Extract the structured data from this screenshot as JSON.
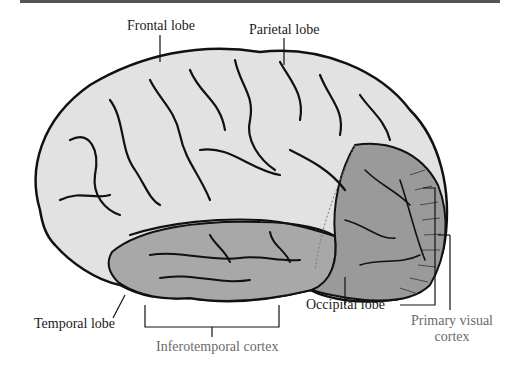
{
  "figure": {
    "type": "lateral-brain-diagram",
    "colors": {
      "frontal_parietal_fill": "#e2e2e2",
      "temporal_fill": "#a8a8a8",
      "occipital_fill": "#9a9a9a",
      "outline": "#111111",
      "label_dark": "#1a1a1a",
      "label_muted": "#6a6a6a"
    },
    "labels": {
      "frontal": "Frontal lobe",
      "parietal": "Parietal lobe",
      "temporal": "Temporal lobe",
      "occipital": "Occipital lobe",
      "inferotemporal": "Inferotemporal cortex",
      "primary_visual_line1": "Primary visual",
      "primary_visual_line2": "cortex"
    }
  }
}
